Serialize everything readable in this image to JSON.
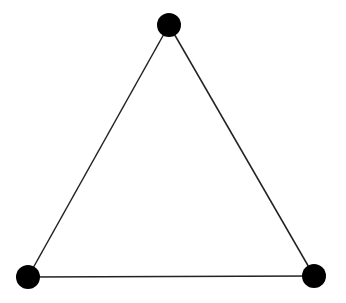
{
  "diagram": {
    "type": "triangle-graph",
    "background": "#ffffff",
    "stroke_color": "#222222",
    "node_color": "#000000",
    "nodes": [
      {
        "id": "top",
        "x": 169,
        "y": 25,
        "r": 12
      },
      {
        "id": "bottom-left",
        "x": 28,
        "y": 277,
        "r": 12
      },
      {
        "id": "bottom-right",
        "x": 314,
        "y": 276,
        "r": 12
      }
    ],
    "edges": [
      {
        "from": "top",
        "to": "bottom-left"
      },
      {
        "from": "top",
        "to": "bottom-right"
      },
      {
        "from": "bottom-left",
        "to": "bottom-right"
      }
    ]
  }
}
